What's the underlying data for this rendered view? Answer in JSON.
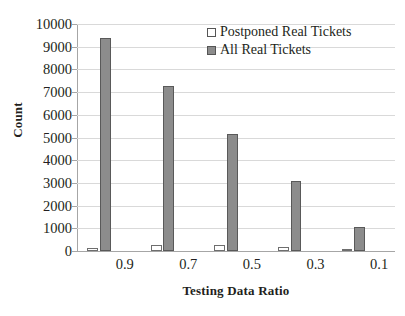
{
  "chart_data": {
    "type": "bar",
    "title": "",
    "xlabel": "Testing Data Ratio",
    "ylabel": "Count",
    "categories": [
      "0.9",
      "0.7",
      "0.5",
      "0.3",
      "0.1"
    ],
    "series": [
      {
        "name": "Postponed Real Tickets",
        "color": "#ffffff",
        "border": "#6e6e6e",
        "values": [
          140,
          250,
          270,
          160,
          60
        ]
      },
      {
        "name": "All Real Tickets",
        "color": "#8c8c8c",
        "border": "#595959",
        "values": [
          9380,
          7280,
          5150,
          3100,
          1060
        ]
      }
    ],
    "ylim": [
      0,
      10000
    ],
    "yticks": [
      "10000",
      "9000",
      "8000",
      "7000",
      "6000",
      "5000",
      "4000",
      "3000",
      "2000",
      "1000",
      "0"
    ],
    "ytick_values": [
      10000,
      9000,
      8000,
      7000,
      6000,
      5000,
      4000,
      3000,
      2000,
      1000,
      0
    ],
    "grid": true,
    "legend_position": "top-right"
  },
  "legend": {
    "items": [
      {
        "label": "Postponed Real Tickets",
        "swatch": "hollow-square-swatch"
      },
      {
        "label": "All Real Tickets",
        "swatch": "filled-square-swatch"
      }
    ]
  },
  "caption": {
    "text": ""
  }
}
